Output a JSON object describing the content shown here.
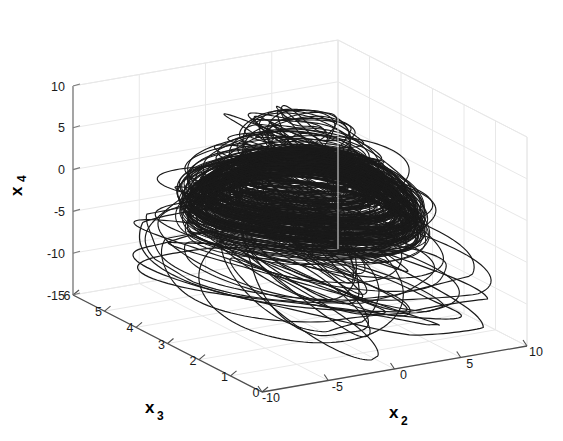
{
  "figure": {
    "background_color": "#ffffff",
    "grid_color": "#e8e8e8",
    "axis_line_color": "#4d4d4d",
    "data_color": "#1a1a1a",
    "width": 563,
    "height": 441
  },
  "chart_data": {
    "type": "line",
    "title": "",
    "subtitle": "",
    "plot_style": "3d-phase-portrait",
    "xlabel": "x_3",
    "ylabel": "x_2",
    "zlabel": "x_4",
    "axes": {
      "x3": {
        "label": "x",
        "subscript": "3",
        "ticks": [
          6,
          5,
          4,
          3,
          2,
          1,
          0
        ],
        "tick_labels": [
          "6",
          "5",
          "4",
          "3",
          "2",
          "1",
          "0"
        ],
        "range": [
          0,
          6
        ],
        "direction": "descending-left-to-right"
      },
      "x2": {
        "label": "x",
        "subscript": "2",
        "ticks": [
          -10,
          -5,
          0,
          5,
          10
        ],
        "tick_labels": [
          "-10",
          "-5",
          "0",
          "5",
          "10"
        ],
        "range": [
          -10,
          10
        ],
        "direction": "ascending-left-to-right"
      },
      "x4": {
        "label": "x",
        "subscript": "4",
        "ticks": [
          10,
          5,
          0,
          -5,
          -10,
          -15
        ],
        "tick_labels": [
          "10",
          "5",
          "0",
          "-5",
          "-10",
          "-15"
        ],
        "range": [
          -15,
          10
        ],
        "direction": "ascending-bottom-to-top"
      }
    },
    "grid": true,
    "legend": null,
    "box": true,
    "trajectory": {
      "n_orbits": 74,
      "points_per_orbit": 132,
      "center": {
        "x3": 3.0,
        "x2": 0.2,
        "x4": 0.5
      },
      "radius_x2_range": [
        1.2,
        10.2
      ],
      "radius_x3_range": [
        0.45,
        3.2
      ],
      "x4_range": [
        -13.5,
        9.0
      ],
      "seed": 20240517
    }
  }
}
